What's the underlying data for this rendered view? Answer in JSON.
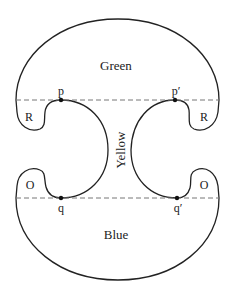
{
  "diagram": {
    "regions": {
      "top": "Green",
      "middle": "Yellow",
      "bottom": "Blue",
      "top_left_lobe": "R",
      "top_right_lobe": "R",
      "bottom_left_lobe": "O",
      "bottom_right_lobe": "O"
    },
    "points": {
      "p": "p",
      "p_prime": "p′",
      "q": "q",
      "q_prime": "q′"
    },
    "colors": {
      "stroke": "#222222",
      "dashed": "#777777",
      "background": "#ffffff"
    }
  }
}
